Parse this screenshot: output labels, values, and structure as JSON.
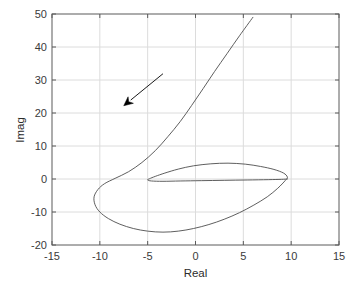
{
  "chart_data": {
    "type": "line",
    "title": "",
    "subtitle": "",
    "xlabel": "Real",
    "ylabel": "Imag",
    "xlim": [
      -15,
      15
    ],
    "ylim": [
      -20,
      50
    ],
    "xticks": [
      -15,
      -10,
      -5,
      0,
      5,
      10,
      15
    ],
    "yticks": [
      -20,
      -10,
      0,
      10,
      20,
      30,
      40,
      50
    ],
    "xtick_labels": [
      "-15",
      "-10",
      "-5",
      "0",
      "5",
      "10",
      "15"
    ],
    "ytick_labels": [
      "-20",
      "-10",
      "0",
      "10",
      "20",
      "30",
      "40",
      "50"
    ],
    "grid": true,
    "legend": null,
    "legend_position": "none",
    "series": [
      {
        "name": "nyquist-locus",
        "color": "#4d4d4d",
        "linewidth": 0.9,
        "points": [
          [
            6.0,
            49.0
          ],
          [
            4.6,
            43.4
          ],
          [
            3.3,
            38.0
          ],
          [
            2.0,
            32.6
          ],
          [
            0.8,
            27.4
          ],
          [
            -0.4,
            22.3
          ],
          [
            -1.6,
            17.4
          ],
          [
            -2.9,
            12.8
          ],
          [
            -4.2,
            8.6
          ],
          [
            -5.6,
            5.0
          ],
          [
            -7.0,
            2.2
          ],
          [
            -8.4,
            0.2
          ],
          [
            -9.5,
            -1.4
          ],
          [
            -10.2,
            -3.2
          ],
          [
            -10.6,
            -5.4
          ],
          [
            -10.5,
            -7.8
          ],
          [
            -10.0,
            -10.0
          ],
          [
            -9.1,
            -12.0
          ],
          [
            -7.9,
            -13.7
          ],
          [
            -6.5,
            -15.0
          ],
          [
            -5.0,
            -15.8
          ],
          [
            -3.4,
            -16.1
          ],
          [
            -1.8,
            -15.8
          ],
          [
            -0.2,
            -15.0
          ],
          [
            1.4,
            -13.8
          ],
          [
            3.0,
            -12.2
          ],
          [
            4.6,
            -10.2
          ],
          [
            6.1,
            -7.9
          ],
          [
            7.5,
            -5.4
          ],
          [
            8.6,
            -2.8
          ],
          [
            9.4,
            -0.4
          ],
          [
            9.6,
            0.6
          ],
          [
            9.2,
            1.8
          ],
          [
            8.2,
            2.9
          ],
          [
            6.8,
            3.8
          ],
          [
            5.2,
            4.5
          ],
          [
            3.4,
            4.8
          ],
          [
            1.6,
            4.6
          ],
          [
            -0.2,
            4.0
          ],
          [
            -1.8,
            3.0
          ],
          [
            -3.2,
            1.8
          ],
          [
            -4.2,
            0.8
          ],
          [
            -4.8,
            0.1
          ],
          [
            -5.0,
            -0.3
          ],
          [
            -4.6,
            -0.6
          ],
          [
            -3.4,
            -0.7
          ],
          [
            -1.6,
            -0.6
          ],
          [
            0.6,
            -0.5
          ],
          [
            3.0,
            -0.4
          ],
          [
            5.4,
            -0.3
          ],
          [
            7.6,
            -0.2
          ],
          [
            9.0,
            -0.1
          ],
          [
            9.6,
            0.0
          ]
        ]
      }
    ],
    "annotations": [
      {
        "name": "direction-arrow",
        "type": "arrow",
        "from": [
          -3.4,
          31.9
        ],
        "to": [
          -7.5,
          22.2
        ],
        "color": "#000000",
        "description": "arrow indicating direction of increasing frequency along the locus"
      }
    ]
  }
}
